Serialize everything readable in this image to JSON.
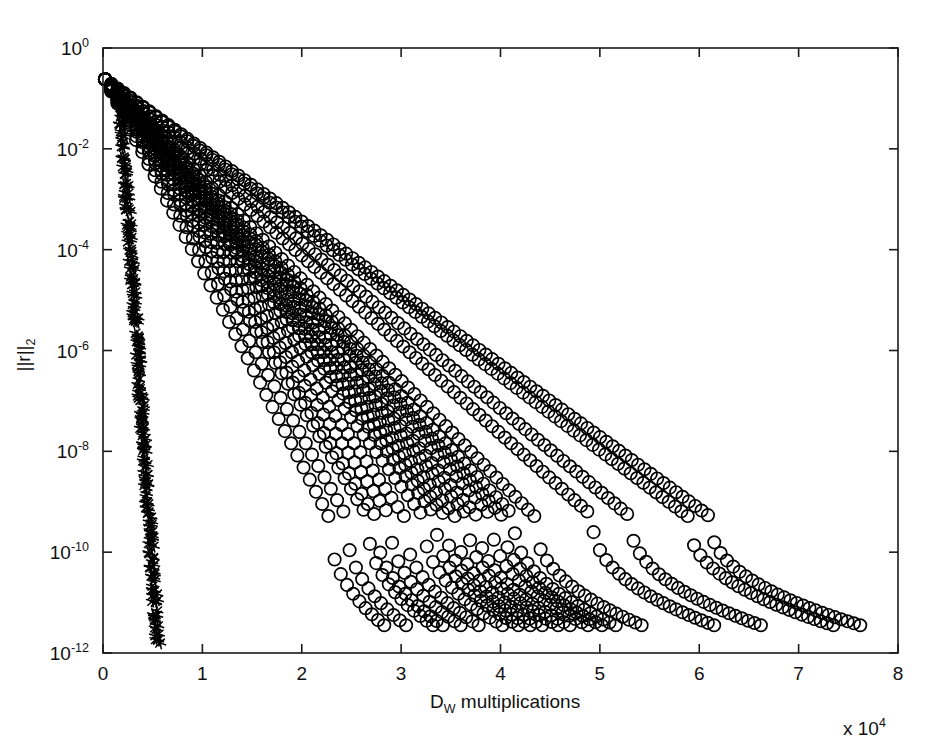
{
  "chart_data": {
    "type": "scatter",
    "title": "",
    "subtitle": "",
    "xlabel": "D_W multiplications",
    "xlabel_base": "D",
    "xlabel_sub": "W",
    "xlabel_rest": " multiplications",
    "x_multiplier": "x 10",
    "x_multiplier_exp": "4",
    "ylabel": "||r||_2",
    "ylabel_base": "||r||",
    "ylabel_sub": "2",
    "xlim": [
      0,
      8
    ],
    "ylim_log10": [
      -12,
      0
    ],
    "xticks": [
      0,
      1,
      2,
      3,
      4,
      5,
      6,
      7,
      8
    ],
    "xtick_labels": [
      "0",
      "1",
      "2",
      "3",
      "4",
      "5",
      "6",
      "7",
      "8"
    ],
    "ytick_exponents": [
      0,
      -2,
      -4,
      -6,
      -8,
      -10,
      -12
    ],
    "ytick_labels": [
      "10^0",
      "10^-2",
      "10^-4",
      "10^-6",
      "10^-8",
      "10^-10",
      "10^-12"
    ],
    "ytick_base": "10",
    "ytick_sups": [
      "0",
      "-2",
      "-4",
      "-6",
      "-8",
      "-10",
      "-12"
    ],
    "grid": false,
    "legend": false,
    "legend_position": "none",
    "marker_colors": {
      "circle": "#000000",
      "star": "#000000"
    },
    "annotations": [],
    "series": [
      {
        "name": "star-cluster",
        "marker": "*",
        "x_start": 0.18,
        "x_end": 0.55,
        "y_start_log10": -1.2,
        "y_end_log10": -11.8,
        "n_points": 240,
        "jitter_x": 0.055,
        "jitter_y": 0.22,
        "description": "near-vertical dense asterisk clusters at left edge"
      },
      {
        "name": "circle-curve-1",
        "marker": "o",
        "x_end": 2.83,
        "y_start_log10": -0.62,
        "n_points": 46,
        "tail_frac": 0.8
      },
      {
        "name": "circle-curve-2",
        "marker": "o",
        "x_end": 3.05,
        "y_start_log10": -0.62,
        "n_points": 49,
        "tail_frac": 0.8
      },
      {
        "name": "circle-curve-3",
        "marker": "o",
        "x_end": 3.32,
        "y_start_log10": -0.62,
        "n_points": 53,
        "tail_frac": 0.8
      },
      {
        "name": "circle-curve-4",
        "marker": "o",
        "x_end": 3.42,
        "y_start_log10": -0.62,
        "n_points": 55,
        "tail_frac": 0.8
      },
      {
        "name": "circle-curve-5",
        "marker": "o",
        "x_end": 3.6,
        "y_start_log10": -0.62,
        "n_points": 58,
        "tail_frac": 0.8
      },
      {
        "name": "circle-curve-6",
        "marker": "o",
        "x_end": 3.78,
        "y_start_log10": -0.62,
        "n_points": 61,
        "tail_frac": 0.8
      },
      {
        "name": "circle-curve-7",
        "marker": "o",
        "x_end": 4.02,
        "y_start_log10": -0.62,
        "n_points": 64,
        "tail_frac": 0.8
      },
      {
        "name": "circle-curve-8",
        "marker": "o",
        "x_end": 4.18,
        "y_start_log10": -0.62,
        "n_points": 67,
        "tail_frac": 0.8
      },
      {
        "name": "circle-curve-9",
        "marker": "o",
        "x_end": 4.3,
        "y_start_log10": -0.62,
        "n_points": 69,
        "tail_frac": 0.8
      },
      {
        "name": "circle-curve-10",
        "marker": "o",
        "x_end": 4.42,
        "y_start_log10": -0.62,
        "n_points": 71,
        "tail_frac": 0.8
      },
      {
        "name": "circle-curve-11",
        "marker": "o",
        "x_end": 4.58,
        "y_start_log10": -0.62,
        "n_points": 73,
        "tail_frac": 0.8
      },
      {
        "name": "circle-curve-12",
        "marker": "o",
        "x_end": 4.7,
        "y_start_log10": -0.62,
        "n_points": 75,
        "tail_frac": 0.8
      },
      {
        "name": "circle-curve-13",
        "marker": "o",
        "x_end": 4.88,
        "y_start_log10": -0.62,
        "n_points": 78,
        "tail_frac": 0.8
      },
      {
        "name": "circle-curve-14",
        "marker": "o",
        "x_end": 5.02,
        "y_start_log10": -0.62,
        "n_points": 80,
        "tail_frac": 0.8
      },
      {
        "name": "circle-curve-15",
        "marker": "o",
        "x_end": 5.16,
        "y_start_log10": -0.62,
        "n_points": 82,
        "tail_frac": 0.8
      },
      {
        "name": "circle-curve-16",
        "marker": "o",
        "x_end": 5.42,
        "y_start_log10": -0.62,
        "n_points": 86,
        "tail_frac": 0.8
      },
      {
        "name": "circle-curve-17",
        "marker": "o",
        "x_end": 6.15,
        "y_start_log10": -0.62,
        "n_points": 97,
        "tail_frac": 0.8
      },
      {
        "name": "circle-curve-18",
        "marker": "o",
        "x_end": 6.62,
        "y_start_log10": -0.62,
        "n_points": 104,
        "tail_frac": 0.8
      },
      {
        "name": "circle-curve-19",
        "marker": "o",
        "x_end": 7.35,
        "y_start_log10": -0.62,
        "n_points": 116,
        "tail_frac": 0.8
      },
      {
        "name": "circle-curve-20",
        "marker": "o",
        "x_end": 7.62,
        "y_start_log10": -0.62,
        "n_points": 120,
        "tail_frac": 0.8
      }
    ],
    "y_floor_log10": -11.45,
    "x_start": 0.02
  },
  "plot_geometry": {
    "left_px": 103,
    "right_px": 898,
    "top_px": 48,
    "bottom_px": 653
  }
}
